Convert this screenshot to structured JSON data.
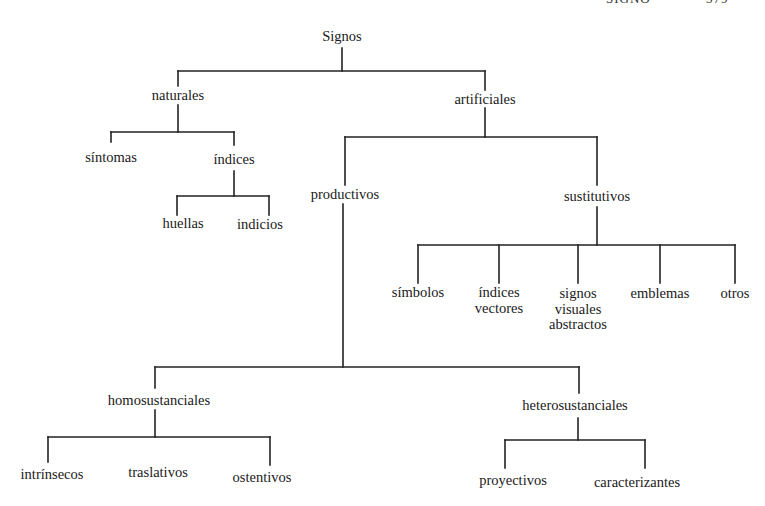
{
  "page_header": {
    "running_title": "SIGNO",
    "page_number": "379"
  },
  "diagram": {
    "title": "Signos",
    "root": {
      "label": "Signos",
      "children": [
        {
          "label": "naturales",
          "children": [
            {
              "label": "síntomas"
            },
            {
              "label": "índices",
              "children": [
                {
                  "label": "huellas"
                },
                {
                  "label": "indicios"
                }
              ]
            }
          ]
        },
        {
          "label": "artificiales",
          "children": [
            {
              "label": "productivos",
              "children": [
                {
                  "label": "homosustanciales",
                  "children": [
                    {
                      "label": "intrínsecos"
                    },
                    {
                      "label": "traslativos"
                    },
                    {
                      "label": "ostentivos"
                    }
                  ]
                },
                {
                  "label": "heterosustanciales",
                  "children": [
                    {
                      "label": "proyectivos"
                    },
                    {
                      "label": "caracterizantes"
                    }
                  ]
                }
              ]
            },
            {
              "label": "sustitutivos",
              "children": [
                {
                  "label": "símbolos"
                },
                {
                  "label": "índices\nvectores"
                },
                {
                  "label": "signos\nvisuales\nabstractos"
                },
                {
                  "label": "emblemas"
                },
                {
                  "label": "otros"
                }
              ]
            }
          ]
        }
      ]
    }
  },
  "nodes": {
    "signos": "Signos",
    "naturales": "naturales",
    "artificiales": "artificiales",
    "sintomas": "síntomas",
    "indices": "índices",
    "huellas": "huellas",
    "indicios": "indicios",
    "productivos": "productivos",
    "sustitutivos": "sustitutivos",
    "simbolos": "símbolos",
    "indices_vectores": "índices\nvectores",
    "signos_visuales_abstractos": "signos\nvisuales\nabstractos",
    "emblemas": "emblemas",
    "otros": "otros",
    "homosustanciales": "homosustanciales",
    "heterosustanciales": "heterosustanciales",
    "intrinsecos": "intrínsecos",
    "traslativos": "traslativos",
    "ostentivos": "ostentivos",
    "proyectivos": "proyectivos",
    "caracterizantes": "caracterizantes"
  }
}
